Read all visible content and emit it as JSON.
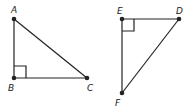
{
  "diagram": {
    "stroke_color": "#222222",
    "triangles": [
      {
        "name": "ABC",
        "right_angle_at": "B",
        "points": {
          "A": {
            "label": "A",
            "x": 14,
            "y": 19
          },
          "B": {
            "label": "B",
            "x": 14,
            "y": 78
          },
          "C": {
            "label": "C",
            "x": 87,
            "y": 78
          }
        }
      },
      {
        "name": "DEF",
        "right_angle_at": "E",
        "points": {
          "E": {
            "label": "E",
            "x": 122,
            "y": 19
          },
          "D": {
            "label": "D",
            "x": 179,
            "y": 19
          },
          "F": {
            "label": "F",
            "x": 122,
            "y": 93
          }
        }
      }
    ]
  }
}
